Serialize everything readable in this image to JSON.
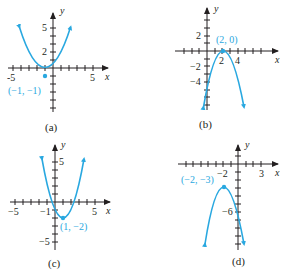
{
  "colors": {
    "curve": "#29a8e0",
    "axis": "#231f20"
  },
  "graphs": [
    {
      "caption": "(a)",
      "x_axis_label": "x",
      "y_axis_label": "y",
      "x_tick_labels": [
        "-5",
        "5"
      ],
      "y_tick_labels": [
        "5",
        "2"
      ],
      "vertex_label": "(−1, −1)",
      "vertex": [
        -1,
        -1
      ],
      "opens": "up"
    },
    {
      "caption": "(b)",
      "x_axis_label": "x",
      "y_axis_label": "y",
      "x_tick_labels": [
        "2",
        "4"
      ],
      "y_tick_labels": [
        "2",
        "−2",
        "−4"
      ],
      "vertex_label": "(2, 0)",
      "vertex": [
        2,
        0
      ],
      "opens": "down"
    },
    {
      "caption": "(c)",
      "x_axis_label": "x",
      "y_axis_label": "y",
      "x_tick_labels": [
        "−5",
        "−1",
        "5"
      ],
      "y_tick_labels": [
        "5",
        "−5"
      ],
      "vertex_label": "(1, −2)",
      "vertex": [
        1,
        -2
      ],
      "opens": "up"
    },
    {
      "caption": "(d)",
      "x_axis_label": "x",
      "y_axis_label": "y",
      "x_tick_labels": [
        "−2",
        "3"
      ],
      "y_tick_labels": [
        "−6"
      ],
      "vertex_label": "(−2, −3)",
      "vertex": [
        -2,
        -3
      ],
      "opens": "down"
    }
  ]
}
